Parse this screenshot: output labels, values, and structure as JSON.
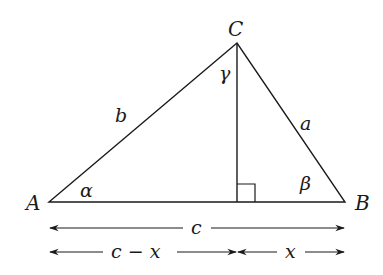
{
  "figure": {
    "type": "triangle-with-altitude",
    "vertices": {
      "A": {
        "label": "A",
        "x": 49,
        "y": 202
      },
      "B": {
        "label": "B",
        "x": 345,
        "y": 202
      },
      "C": {
        "label": "C",
        "x": 237,
        "y": 43
      }
    },
    "altitude_foot": {
      "x": 237,
      "y": 202
    },
    "right_angle_marker_size": 18,
    "sides": {
      "a": "a",
      "b": "b",
      "c": "c"
    },
    "angles": {
      "alpha": "α",
      "beta": "β",
      "gamma": "γ"
    },
    "dimensions": {
      "full_base": "c",
      "left_segment": "c − x",
      "right_segment": "x"
    },
    "colors": {
      "stroke": "#1a1a1a",
      "background": "#ffffff"
    }
  }
}
